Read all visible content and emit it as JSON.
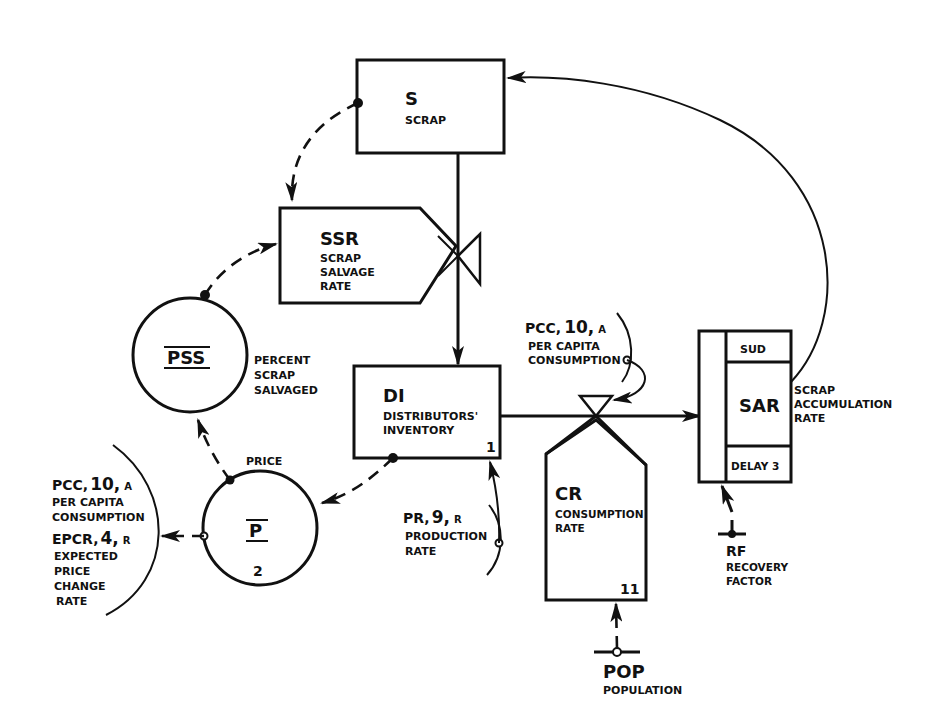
{
  "diagram": {
    "type": "system-dynamics-flow-diagram",
    "nodes": {
      "scrap": {
        "symbol": "S",
        "label": "SCRAP",
        "kind": "level"
      },
      "ssr": {
        "symbol": "SSR",
        "label_lines": [
          "SCRAP",
          "SALVAGE",
          "RATE"
        ],
        "kind": "rate"
      },
      "pss": {
        "symbol": "PSS",
        "label_lines": [
          "PERCENT",
          "SCRAP",
          "SALVAGED"
        ],
        "kind": "auxiliary"
      },
      "di": {
        "symbol": "DI",
        "label_lines": [
          "DISTRIBUTORS'",
          "INVENTORY"
        ],
        "number": "1",
        "kind": "level"
      },
      "price": {
        "symbol": "P",
        "label": "PRICE",
        "number": "2",
        "kind": "auxiliary"
      },
      "cr": {
        "symbol": "CR",
        "label_lines": [
          "CONSUMPTION",
          "RATE"
        ],
        "number": "11",
        "kind": "rate"
      },
      "sar": {
        "symbol": "SAR",
        "top": "SUD",
        "bottom": "DELAY 3",
        "label_lines": [
          "SCRAP",
          "ACCUMULATION",
          "RATE"
        ],
        "kind": "delay"
      },
      "rf": {
        "symbol": "RF",
        "label_lines": [
          "RECOVERY",
          "FACTOR"
        ],
        "kind": "constant"
      },
      "pop": {
        "symbol": "POP",
        "label": "POPULATION",
        "kind": "constant"
      }
    },
    "annotations": {
      "pcc_top": {
        "code": "PCC,",
        "num": "10,",
        "type": "A",
        "label_lines": [
          "PER CAPITA",
          "CONSUMPTION"
        ]
      },
      "pcc_left": {
        "code": "PCC,",
        "num": "10,",
        "type": "A",
        "label_lines": [
          "PER CAPITA",
          "CONSUMPTION"
        ]
      },
      "epcr": {
        "code": "EPCR,",
        "num": "4,",
        "type": "R",
        "label_lines": [
          "EXPECTED",
          "PRICE",
          "CHANGE",
          "RATE"
        ]
      },
      "pr": {
        "code": "PR,",
        "num": "9,",
        "type": "R",
        "label_lines": [
          "PRODUCTION",
          "RATE"
        ]
      }
    },
    "colors": {
      "ink": "#111111",
      "background": "#ffffff"
    }
  }
}
